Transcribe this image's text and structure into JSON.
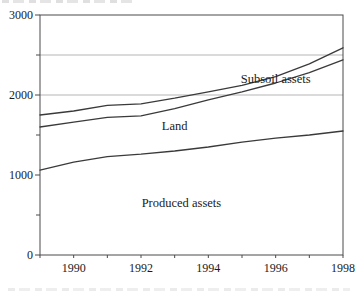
{
  "chart_data": {
    "type": "line",
    "title": "",
    "xlabel": "",
    "ylabel": "",
    "xlim": [
      1989,
      1998
    ],
    "ylim": [
      0,
      3000
    ],
    "x_years": [
      1989,
      1990,
      1991,
      1992,
      1993,
      1994,
      1995,
      1996,
      1997,
      1998
    ],
    "yticks_labeled": [
      0,
      1000,
      2000,
      3000
    ],
    "yticks_minor": [
      500,
      1500,
      2500
    ],
    "gridlines_y": [
      2000,
      2500
    ],
    "xticks_labeled": [
      1990,
      1992,
      1994,
      1996,
      1998
    ],
    "xticks_minor": [
      1989,
      1990,
      1991,
      1992,
      1993,
      1994,
      1995,
      1996,
      1997,
      1998
    ],
    "stacked": true,
    "note": "Lines are cumulative stacked band boundaries: bottom = Produced assets, middle = Produced + Land, top = Produced + Land + Subsoil assets. Values read from y-axis.",
    "series": [
      {
        "label": "Produced assets",
        "boundary": "bottom",
        "values": [
          1060,
          1160,
          1230,
          1260,
          1300,
          1350,
          1410,
          1460,
          1500,
          1550
        ]
      },
      {
        "label": "Land",
        "boundary": "middle",
        "values": [
          1600,
          1660,
          1720,
          1740,
          1830,
          1940,
          2040,
          2150,
          2280,
          2440
        ]
      },
      {
        "label": "Subsoil assets",
        "boundary": "top",
        "values": [
          1750,
          1800,
          1870,
          1890,
          1960,
          2040,
          2120,
          2230,
          2390,
          2590
        ]
      }
    ],
    "annotations": [
      {
        "text": "Subsoil assets",
        "x": 1996.0,
        "y": 2210
      },
      {
        "text": "Land",
        "x": 1993.0,
        "y": 1620
      },
      {
        "text": "Produced assets",
        "x": 1993.2,
        "y": 650
      }
    ],
    "legend": "none (in-chart band labels)",
    "grid": "partial (horizontal lines at 2000 and 2500 only)",
    "colors": {
      "line": "#3a3a3a",
      "grid": "#b5b5b5",
      "axis": "#4a4a4a",
      "text": "#1a1a1a",
      "background": "#ffffff"
    }
  }
}
